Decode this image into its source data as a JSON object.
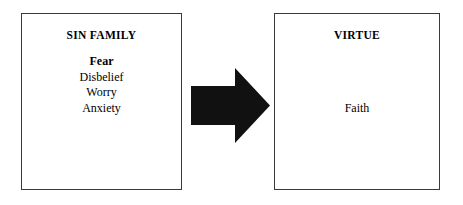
{
  "diagram": {
    "type": "transformation-flow",
    "background_color": "#ffffff",
    "border_color": "#3a3a3a",
    "text_color": "#000000",
    "arrow_color": "#111111",
    "left_box": {
      "title": "SIN FAMILY",
      "items": [
        {
          "label": "Fear",
          "emphasis": true
        },
        {
          "label": "Disbelief",
          "emphasis": false
        },
        {
          "label": "Worry",
          "emphasis": false
        },
        {
          "label": "Anxiety",
          "emphasis": false
        }
      ]
    },
    "connector": {
      "icon": "arrow-right-block-icon",
      "direction": "right"
    },
    "right_box": {
      "title": "VIRTUE",
      "items": [
        {
          "label": "Faith",
          "emphasis": false
        }
      ]
    }
  }
}
